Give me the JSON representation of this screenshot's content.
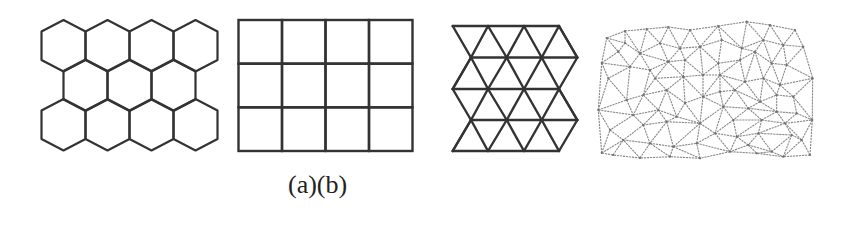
{
  "figure": {
    "caption": "(a)(b)",
    "colors": {
      "stroke": "#333333",
      "mesh_stroke": "#8a8a8a",
      "background": "#ffffff"
    },
    "panels": [
      {
        "name": "hexagonal-grid",
        "type": "hexagon",
        "rows": 3,
        "cols_per_row": [
          4,
          3,
          4
        ],
        "origin_center_x": 63.5,
        "hex_half_width": 22,
        "row_tops": [
          20,
          59.5,
          99
        ],
        "tip_height": 11.5,
        "side_height": 28.5,
        "stroke_width": 2.2
      },
      {
        "name": "square-grid",
        "type": "square",
        "x": 238.5,
        "y": 20,
        "width": 174,
        "height": 131,
        "cols": 4,
        "rows": 3,
        "stroke_width": 2.4
      },
      {
        "name": "triangular-grid",
        "type": "triangle",
        "row_y": [
          26,
          57.5,
          89,
          120,
          151
        ],
        "even_row_x": [
          452.7,
          488,
          524,
          559
        ],
        "odd_row_x": [
          471,
          506.7,
          541.7,
          577.3
        ],
        "stroke_width": 2.4
      },
      {
        "name": "irregular-triangular-mesh",
        "type": "mesh",
        "stroke_width": 1.1,
        "nodes": [
          [
            606.7,
            38
          ],
          [
            625,
            31
          ],
          [
            646.7,
            29
          ],
          [
            668.3,
            27
          ],
          [
            690,
            30
          ],
          [
            718.3,
            26
          ],
          [
            746.7,
            21.7
          ],
          [
            770,
            25
          ],
          [
            795,
            30
          ],
          [
            803.3,
            46.7
          ],
          [
            812.7,
            78.3
          ],
          [
            812.3,
            120
          ],
          [
            810,
            155
          ],
          [
            783.3,
            156.7
          ],
          [
            756.7,
            153.3
          ],
          [
            730,
            151.7
          ],
          [
            700,
            158.3
          ],
          [
            670,
            156.7
          ],
          [
            640,
            158
          ],
          [
            613,
            155
          ],
          [
            601.7,
            153
          ],
          [
            598.3,
            110
          ],
          [
            601.7,
            63
          ],
          [
            618.3,
            51.7
          ],
          [
            640,
            53.3
          ],
          [
            660,
            43.3
          ],
          [
            680,
            48.3
          ],
          [
            700,
            46.7
          ],
          [
            630,
            66.7
          ],
          [
            650,
            70
          ],
          [
            668.3,
            61.7
          ],
          [
            685,
            60
          ],
          [
            608.3,
            78.3
          ],
          [
            655,
            78.3
          ],
          [
            683.3,
            76.7
          ],
          [
            703,
            75
          ],
          [
            626.7,
            100
          ],
          [
            643.3,
            95
          ],
          [
            666.7,
            90
          ],
          [
            685,
            103
          ],
          [
            703,
            96.7
          ],
          [
            633.3,
            115
          ],
          [
            658.3,
            110
          ],
          [
            676.7,
            116.7
          ],
          [
            610,
            130
          ],
          [
            643.3,
            125
          ],
          [
            666.7,
            121.7
          ],
          [
            700,
            123.3
          ],
          [
            623.3,
            140
          ],
          [
            650,
            143.3
          ],
          [
            673.3,
            146.7
          ],
          [
            696.7,
            143.3
          ],
          [
            721.7,
            40
          ],
          [
            741.7,
            48.3
          ],
          [
            763.3,
            40
          ],
          [
            783.3,
            45
          ],
          [
            718.3,
            63.3
          ],
          [
            740,
            60
          ],
          [
            755,
            51.7
          ],
          [
            771.7,
            63.3
          ],
          [
            786.7,
            65
          ],
          [
            745,
            81.7
          ],
          [
            763.3,
            78.3
          ],
          [
            780,
            85
          ],
          [
            720,
            91.7
          ],
          [
            735,
            90
          ],
          [
            760,
            101.7
          ],
          [
            776.7,
            95
          ],
          [
            793.3,
            96.7
          ],
          [
            723.3,
            106.7
          ],
          [
            748.3,
            108.3
          ],
          [
            776.7,
            111.7
          ],
          [
            796.7,
            113.3
          ],
          [
            733.3,
            120
          ],
          [
            761.7,
            120
          ],
          [
            785,
            123.3
          ],
          [
            715,
            133.3
          ],
          [
            736.7,
            136.7
          ],
          [
            758.3,
            133.3
          ],
          [
            791.7,
            135
          ],
          [
            748.3,
            145
          ],
          [
            771.7,
            151.7
          ],
          [
            801.7,
            140
          ],
          [
            625,
            43
          ],
          [
            720,
            75
          ]
        ],
        "edges": [
          [
            0,
            1
          ],
          [
            1,
            2
          ],
          [
            2,
            3
          ],
          [
            3,
            4
          ],
          [
            4,
            5
          ],
          [
            5,
            6
          ],
          [
            6,
            7
          ],
          [
            7,
            8
          ],
          [
            8,
            9
          ],
          [
            9,
            10
          ],
          [
            10,
            11
          ],
          [
            11,
            12
          ],
          [
            12,
            13
          ],
          [
            13,
            14
          ],
          [
            14,
            15
          ],
          [
            15,
            16
          ],
          [
            16,
            17
          ],
          [
            17,
            18
          ],
          [
            18,
            19
          ],
          [
            19,
            20
          ],
          [
            20,
            21
          ],
          [
            21,
            22
          ],
          [
            22,
            0
          ],
          [
            0,
            83
          ],
          [
            1,
            83
          ],
          [
            83,
            23
          ],
          [
            0,
            23
          ],
          [
            22,
            23
          ],
          [
            83,
            24
          ],
          [
            1,
            24
          ],
          [
            2,
            24
          ],
          [
            2,
            25
          ],
          [
            24,
            25
          ],
          [
            3,
            25
          ],
          [
            25,
            26
          ],
          [
            3,
            26
          ],
          [
            4,
            26
          ],
          [
            4,
            27
          ],
          [
            26,
            27
          ],
          [
            27,
            5
          ],
          [
            27,
            52
          ],
          [
            5,
            52
          ],
          [
            23,
            28
          ],
          [
            24,
            28
          ],
          [
            22,
            28
          ],
          [
            22,
            32
          ],
          [
            28,
            32
          ],
          [
            24,
            29
          ],
          [
            28,
            29
          ],
          [
            25,
            30
          ],
          [
            24,
            30
          ],
          [
            29,
            30
          ],
          [
            26,
            30
          ],
          [
            26,
            31
          ],
          [
            30,
            31
          ],
          [
            27,
            31
          ],
          [
            31,
            35
          ],
          [
            27,
            35
          ],
          [
            29,
            33
          ],
          [
            30,
            33
          ],
          [
            30,
            34
          ],
          [
            31,
            34
          ],
          [
            33,
            34
          ],
          [
            34,
            35
          ],
          [
            32,
            36
          ],
          [
            28,
            36
          ],
          [
            29,
            37
          ],
          [
            36,
            37
          ],
          [
            33,
            37
          ],
          [
            33,
            38
          ],
          [
            37,
            38
          ],
          [
            34,
            38
          ],
          [
            34,
            39
          ],
          [
            38,
            39
          ],
          [
            35,
            40
          ],
          [
            39,
            40
          ],
          [
            34,
            40
          ],
          [
            21,
            32
          ],
          [
            21,
            36
          ],
          [
            21,
            41
          ],
          [
            36,
            41
          ],
          [
            37,
            41
          ],
          [
            37,
            42
          ],
          [
            41,
            42
          ],
          [
            38,
            42
          ],
          [
            42,
            43
          ],
          [
            38,
            43
          ],
          [
            39,
            43
          ],
          [
            43,
            47
          ],
          [
            39,
            47
          ],
          [
            40,
            47
          ],
          [
            21,
            44
          ],
          [
            41,
            44
          ],
          [
            41,
            45
          ],
          [
            42,
            45
          ],
          [
            42,
            46
          ],
          [
            45,
            46
          ],
          [
            43,
            46
          ],
          [
            46,
            47
          ],
          [
            44,
            48
          ],
          [
            45,
            48
          ],
          [
            45,
            49
          ],
          [
            48,
            49
          ],
          [
            46,
            49
          ],
          [
            46,
            50
          ],
          [
            49,
            50
          ],
          [
            47,
            50
          ],
          [
            47,
            51
          ],
          [
            50,
            51
          ],
          [
            20,
            44
          ],
          [
            20,
            48
          ],
          [
            19,
            48
          ],
          [
            18,
            48
          ],
          [
            18,
            49
          ],
          [
            17,
            49
          ],
          [
            17,
            50
          ],
          [
            16,
            50
          ],
          [
            16,
            51
          ],
          [
            51,
            15
          ],
          [
            51,
            76
          ],
          [
            47,
            76
          ],
          [
            47,
            69
          ],
          [
            52,
            53
          ],
          [
            5,
            53
          ],
          [
            6,
            53
          ],
          [
            6,
            54
          ],
          [
            53,
            54
          ],
          [
            7,
            54
          ],
          [
            54,
            55
          ],
          [
            7,
            55
          ],
          [
            8,
            55
          ],
          [
            55,
            9
          ],
          [
            52,
            56
          ],
          [
            27,
            56
          ],
          [
            35,
            56
          ],
          [
            53,
            57
          ],
          [
            56,
            57
          ],
          [
            53,
            58
          ],
          [
            57,
            58
          ],
          [
            54,
            58
          ],
          [
            58,
            59
          ],
          [
            54,
            59
          ],
          [
            55,
            59
          ],
          [
            55,
            60
          ],
          [
            59,
            60
          ],
          [
            9,
            60
          ],
          [
            10,
            60
          ],
          [
            35,
            84
          ],
          [
            56,
            84
          ],
          [
            57,
            84
          ],
          [
            57,
            61
          ],
          [
            84,
            61
          ],
          [
            58,
            61
          ],
          [
            58,
            62
          ],
          [
            61,
            62
          ],
          [
            59,
            62
          ],
          [
            62,
            63
          ],
          [
            59,
            63
          ],
          [
            60,
            63
          ],
          [
            10,
            63
          ],
          [
            40,
            84
          ],
          [
            40,
            64
          ],
          [
            84,
            64
          ],
          [
            64,
            65
          ],
          [
            84,
            65
          ],
          [
            61,
            65
          ],
          [
            61,
            66
          ],
          [
            65,
            66
          ],
          [
            62,
            66
          ],
          [
            66,
            67
          ],
          [
            62,
            67
          ],
          [
            63,
            67
          ],
          [
            67,
            68
          ],
          [
            63,
            68
          ],
          [
            10,
            68
          ],
          [
            68,
            11
          ],
          [
            40,
            69
          ],
          [
            64,
            69
          ],
          [
            65,
            69
          ],
          [
            65,
            70
          ],
          [
            69,
            70
          ],
          [
            66,
            70
          ],
          [
            66,
            71
          ],
          [
            70,
            71
          ],
          [
            67,
            71
          ],
          [
            71,
            72
          ],
          [
            68,
            72
          ],
          [
            72,
            11
          ],
          [
            69,
            73
          ],
          [
            70,
            73
          ],
          [
            70,
            74
          ],
          [
            73,
            74
          ],
          [
            71,
            74
          ],
          [
            74,
            75
          ],
          [
            71,
            75
          ],
          [
            72,
            75
          ],
          [
            75,
            11
          ],
          [
            69,
            76
          ],
          [
            73,
            76
          ],
          [
            73,
            77
          ],
          [
            76,
            77
          ],
          [
            74,
            77
          ],
          [
            74,
            78
          ],
          [
            77,
            78
          ],
          [
            75,
            78
          ],
          [
            75,
            79
          ],
          [
            78,
            79
          ],
          [
            79,
            82
          ],
          [
            11,
            82
          ],
          [
            75,
            82
          ],
          [
            76,
            15
          ],
          [
            77,
            15
          ],
          [
            77,
            80
          ],
          [
            78,
            80
          ],
          [
            80,
            14
          ],
          [
            80,
            15
          ],
          [
            78,
            81
          ],
          [
            80,
            81
          ],
          [
            81,
            14
          ],
          [
            81,
            13
          ],
          [
            79,
            81
          ],
          [
            79,
            13
          ],
          [
            82,
            13
          ],
          [
            82,
            12
          ]
        ]
      }
    ]
  }
}
